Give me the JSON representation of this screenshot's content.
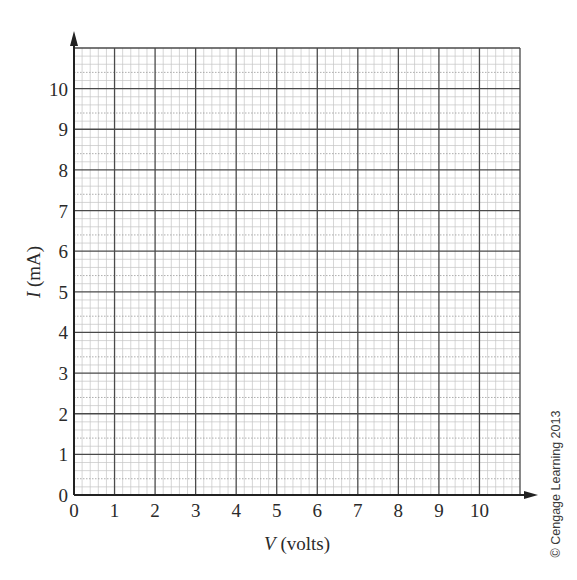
{
  "chart_data": {
    "type": "scatter",
    "title": "",
    "xlabel": "V (volts)",
    "xlabel_var": "V",
    "xlabel_unit": " (volts)",
    "ylabel": "I (mA)",
    "ylabel_var": "I",
    "ylabel_unit": " (mA)",
    "xlim": [
      0,
      11
    ],
    "ylim": [
      0,
      11
    ],
    "x_ticks": [
      0,
      1,
      2,
      3,
      4,
      5,
      6,
      7,
      8,
      9,
      10
    ],
    "y_ticks": [
      0,
      1,
      2,
      3,
      4,
      5,
      6,
      7,
      8,
      9,
      10
    ],
    "x_tick_labels": [
      "0",
      "1",
      "2",
      "3",
      "4",
      "5",
      "6",
      "7",
      "8",
      "9",
      "10"
    ],
    "y_tick_labels": [
      "0",
      "1",
      "2",
      "3",
      "4",
      "5",
      "6",
      "7",
      "8",
      "9",
      "10"
    ],
    "grid": true,
    "minor_subdivisions": 5,
    "series": [],
    "legend": null,
    "note": "Blank graph paper grid for plotting I vs V"
  },
  "credit": "© Cengage Learning 2013",
  "colors": {
    "major_grid": "#4a4a4a",
    "minor_grid": "#c4c4c4",
    "mid_dotted": "#9a9a9a",
    "axis": "#222222",
    "text": "#2a2a2a"
  }
}
